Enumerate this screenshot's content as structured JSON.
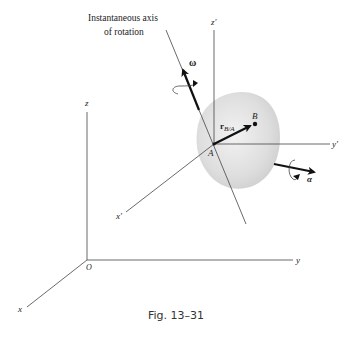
{
  "figure": {
    "caption": "Fig. 13–31",
    "axis_label_line1": "Instantaneous axis",
    "axis_label_line2": "of rotation",
    "fixed_axes": {
      "origin": "O",
      "x": "x",
      "y": "y",
      "z": "z"
    },
    "moving_axes": {
      "origin": "A",
      "x": "x′",
      "y": "y′",
      "z": "z′"
    },
    "point_b": "B",
    "position_vector": "r",
    "position_vector_sub": "B/A",
    "omega": "ω",
    "alpha": "α"
  },
  "colors": {
    "body_fill": "#e2e2e2",
    "line": "#444444",
    "vector": "#111111"
  }
}
